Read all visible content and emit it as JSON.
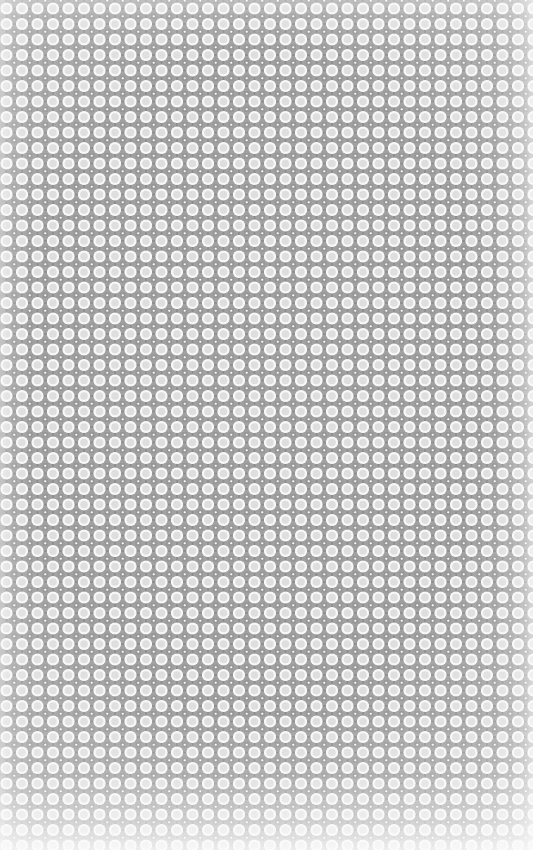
{
  "image": {
    "kind": "seamless-decorative-pattern",
    "description": "Repeating square-lattice wallpaper pattern of large pale circles separated by gray octagonal webbing, with small gray squares containing white dots at the interstitial crossing points.",
    "width_px": 533,
    "height_px": 850,
    "orientation": "portrait"
  },
  "pattern": {
    "motif_name": "circle-and-square-lattice",
    "lattice_type": "square",
    "tile_pitch_px": 15.5,
    "columns_visible": 34,
    "rows_visible": 55,
    "seamless": "true",
    "elements": [
      {
        "name": "large-circle",
        "shape": "circle",
        "diameter_px": 12.2,
        "position": "lattice-node",
        "fill": "#fbfbfb",
        "rim": "#ffffff"
      },
      {
        "name": "inner-disc",
        "shape": "circle",
        "diameter_px": 7.6,
        "position": "centered-in-large-circle",
        "fill": "#e2e2e2"
      },
      {
        "name": "lattice-web",
        "shape": "octagonal-webbing",
        "stroke_px": 1.6,
        "position": "between-circles",
        "fill": "#8d8d8d"
      },
      {
        "name": "interstitial-square",
        "shape": "square",
        "size_px": 5.4,
        "position": "lattice-interstice",
        "fill": "#9a9a9a"
      },
      {
        "name": "interstitial-dot",
        "shape": "circle",
        "diameter_px": 2.2,
        "position": "centered-in-interstitial-square",
        "fill": "#ffffff"
      }
    ]
  },
  "colors": {
    "background": "#f2f2f2",
    "circle_fill": "#fbfbfb",
    "circle_rim": "#ffffff",
    "inner_disc": "#e2e2e2",
    "lattice_gray": "#8d8d8d",
    "lattice_gray_light": "#b4b4b4",
    "square_gray": "#9a9a9a",
    "dot_white": "#ffffff",
    "edge_wash": "#ffffff"
  },
  "effects": {
    "edge_vignette": "light wash on all four edges, strongest at bottom",
    "bottom_fade_height_px": 60,
    "right_fade_width_px": 40,
    "grain": "subtle print grain overlay"
  }
}
